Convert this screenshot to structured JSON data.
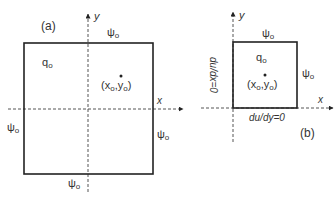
{
  "panel_a": {
    "label": "(a)",
    "x_axis": "x",
    "y_axis": "y",
    "source_label": "q",
    "source_sub": "o",
    "point_label": "(x",
    "point_sub1": "o",
    "point_mid": ",y",
    "point_sub2": "o",
    "point_end": ")",
    "boundary_symbol": "ψ",
    "boundary_sub": "o"
  },
  "panel_b": {
    "label": "(b)",
    "x_axis": "x",
    "y_axis": "y",
    "source_label": "q",
    "source_sub": "o",
    "point_label": "(x",
    "point_sub1": "o",
    "point_mid": ",y",
    "point_sub2": "o",
    "point_end": ")",
    "boundary_symbol": "ψ",
    "boundary_sub": "o",
    "left_bc": "du/dx=0",
    "bottom_bc": "du/dy=0"
  },
  "colors": {
    "line": "#222222",
    "dashed": "#555555"
  }
}
